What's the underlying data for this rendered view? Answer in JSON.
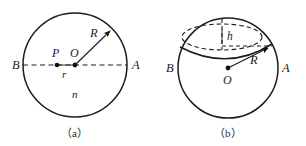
{
  "figure": {
    "panel_a": {
      "caption": "（a）",
      "labels": {
        "point_b": "B",
        "point_a": "A",
        "point_p": "P",
        "point_o": "O",
        "radius_r_big": "R",
        "radius_r_small": "r",
        "index_n": "n"
      },
      "geometry": {
        "circle_center_x": 75,
        "circle_center_y": 65,
        "circle_radius": 52,
        "point_p_x": 57,
        "point_o_x": 75,
        "diameter_y": 65,
        "radius_arrow_end_x": 112,
        "radius_arrow_end_y": 29
      }
    },
    "panel_b": {
      "caption": "（b）",
      "labels": {
        "point_b": "B",
        "point_a": "A",
        "point_o": "O",
        "radius_r_big": "R",
        "cap_height_h": "h"
      },
      "geometry": {
        "sphere_center_x": 228,
        "sphere_center_y": 68,
        "sphere_radius": 50,
        "cap_ellipse_cx": 222,
        "cap_ellipse_cy": 37,
        "cap_ellipse_rx": 40,
        "cap_ellipse_ry": 13,
        "radius_arrow_end_x": 270,
        "radius_arrow_end_y": 47
      }
    }
  },
  "colors": {
    "ink": "#1c1c1c",
    "label_ink": "#1a1a1a",
    "background": "#ffffff"
  }
}
